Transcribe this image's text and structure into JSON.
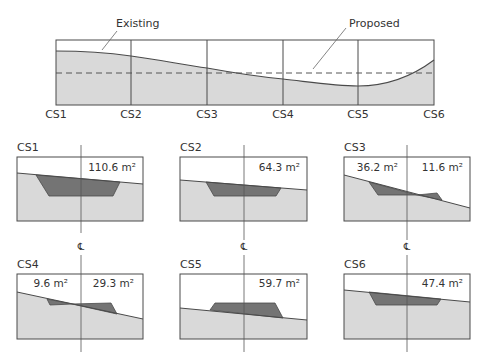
{
  "colors": {
    "ground": "#d9d9d9",
    "earthwork": "#747474",
    "line": "#4a4a4a",
    "leader": "#666666"
  },
  "profile": {
    "existing_label": "Existing",
    "proposed_label": "Proposed",
    "stations": [
      "CS1",
      "CS2",
      "CS3",
      "CS4",
      "CS5",
      "CS6"
    ]
  },
  "sections": [
    {
      "id": "CS1",
      "title": "CS1",
      "areas": [
        "",
        "110.6 m²"
      ]
    },
    {
      "id": "CS2",
      "title": "CS2",
      "areas": [
        "",
        "64.3 m²"
      ]
    },
    {
      "id": "CS3",
      "title": "CS3",
      "areas": [
        "36.2 m²",
        "11.6 m²"
      ]
    },
    {
      "id": "CS4",
      "title": "CS4",
      "areas": [
        "9.6 m²",
        "29.3 m²"
      ]
    },
    {
      "id": "CS5",
      "title": "CS5",
      "areas": [
        "",
        "59.7 m²"
      ]
    },
    {
      "id": "CS6",
      "title": "CS6",
      "areas": [
        "",
        "47.4 m²"
      ]
    }
  ],
  "centerline_symbol": "℄"
}
